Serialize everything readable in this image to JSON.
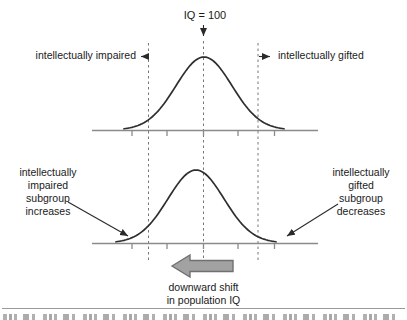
{
  "figure": {
    "top_chart": {
      "mean_label": "IQ = 100",
      "left_region_label": "intellectually impaired",
      "right_region_label": "intellectually gifted"
    },
    "bottom_chart": {
      "left_annotation": "intellectually\nimpaired\nsubgroup\nincreases",
      "right_annotation": "intellectually\ngifted\nsubgroup\ndecreases",
      "shift_annotation": "downward shift\nin population IQ"
    },
    "colors": {
      "curve": "#2e2e2e",
      "axis": "#8a8a8a",
      "dashed_line": "#777777",
      "shift_arrow_fill": "#a2a2a2",
      "shift_arrow_border": "#707070",
      "text": "#1a1a1a"
    }
  }
}
